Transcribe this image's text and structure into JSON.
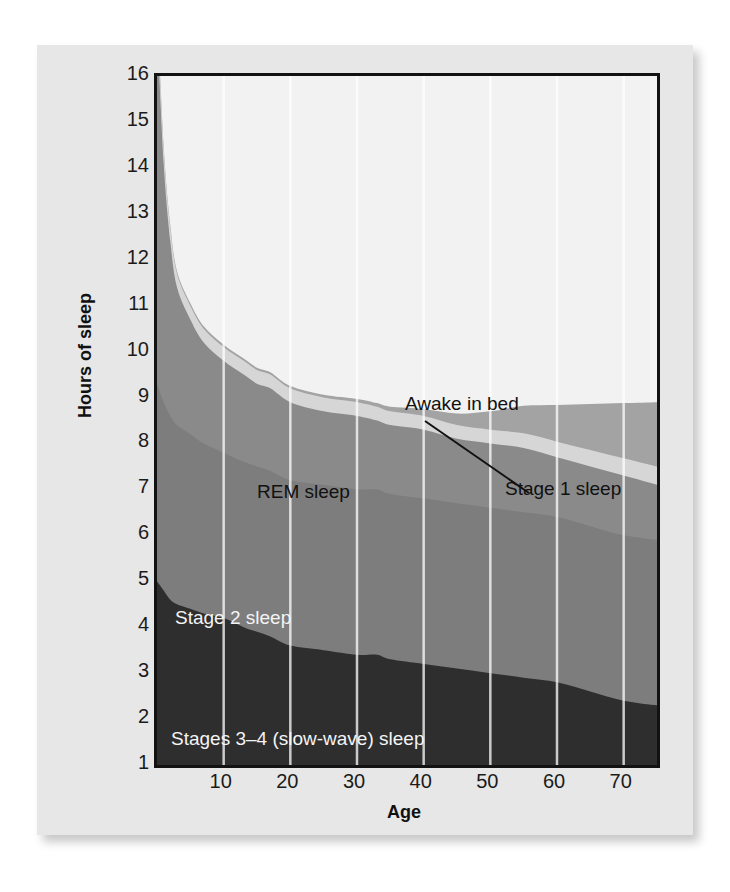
{
  "figure": {
    "background_color": "#e7e7e7",
    "plot_background_color": "#f2f2f2",
    "frame_color": "#121212",
    "gridline_color": "#ffffff"
  },
  "axes": {
    "y_title": "Hours of sleep",
    "x_title": "Age",
    "y_ticks": [
      "16",
      "15",
      "14",
      "13",
      "12",
      "11",
      "10",
      "9",
      "8",
      "7",
      "6",
      "5",
      "4",
      "3",
      "2",
      "1"
    ],
    "x_ticks": [
      "10",
      "20",
      "30",
      "40",
      "50",
      "60",
      "70"
    ]
  },
  "annotations": {
    "awake": "Awake in bed",
    "stage1": "Stage 1 sleep",
    "rem": "REM sleep",
    "stage2": "Stage 2 sleep",
    "stage34": "Stages 3–4 (slow-wave) sleep"
  },
  "chart_data": {
    "type": "area",
    "title": "",
    "subtitle": "",
    "xlabel": "Age",
    "ylabel": "Hours of sleep",
    "xlim": [
      0,
      75
    ],
    "ylim": [
      1,
      16
    ],
    "grid": "vertical gridlines at every 10 years",
    "legend": "inline labels inside bands",
    "stacked": true,
    "note": "Stacked area chart of sleep-stage hours across the lifespan. Bands stack from the bottom: Stages 3-4 (slow-wave) sleep, Stage 2 sleep, REM sleep, Stage 1 sleep, Awake in bed. The top of the stack is total time in bed. Baseline of the plot is 1 hour, not 0.",
    "x": [
      0,
      1,
      2,
      3,
      5,
      7,
      10,
      13,
      15,
      17,
      20,
      25,
      30,
      33,
      35,
      40,
      45,
      50,
      55,
      60,
      65,
      70,
      75
    ],
    "series": [
      {
        "name": "Stages 3–4 (slow-wave) sleep",
        "color": "#2e2e2e",
        "label_color": "#f4f4f4",
        "values": [
          4.0,
          3.8,
          3.6,
          3.5,
          3.4,
          3.3,
          3.2,
          3.0,
          2.9,
          2.8,
          2.6,
          2.5,
          2.4,
          2.4,
          2.3,
          2.2,
          2.1,
          2.0,
          1.9,
          1.8,
          1.6,
          1.4,
          1.3
        ]
      },
      {
        "name": "Stage 2 sleep",
        "color": "#7d7d7d",
        "label_color": "#f4f4f4",
        "values": [
          4.3,
          4.1,
          4.0,
          3.9,
          3.8,
          3.7,
          3.6,
          3.6,
          3.6,
          3.6,
          3.6,
          3.6,
          3.6,
          3.6,
          3.6,
          3.6,
          3.6,
          3.6,
          3.6,
          3.6,
          3.6,
          3.6,
          3.6
        ]
      },
      {
        "name": "REM sleep",
        "color": "#8a8a8a",
        "label_color": "#111111",
        "values": [
          7.8,
          5.2,
          3.8,
          3.0,
          2.5,
          2.2,
          2.0,
          1.9,
          1.8,
          1.8,
          1.7,
          1.6,
          1.6,
          1.5,
          1.5,
          1.5,
          1.4,
          1.4,
          1.4,
          1.3,
          1.3,
          1.3,
          1.2
        ]
      },
      {
        "name": "Stage 1 sleep",
        "color": "#d6d6d6",
        "label_color": "#111111",
        "values": [
          0.35,
          0.32,
          0.3,
          0.3,
          0.3,
          0.3,
          0.3,
          0.3,
          0.3,
          0.3,
          0.3,
          0.3,
          0.3,
          0.3,
          0.3,
          0.3,
          0.3,
          0.3,
          0.32,
          0.34,
          0.36,
          0.38,
          0.4
        ]
      },
      {
        "name": "Awake in bed",
        "color": "#a3a3a3",
        "label_color": "#111111",
        "values": [
          0.05,
          0.05,
          0.05,
          0.05,
          0.05,
          0.05,
          0.05,
          0.05,
          0.05,
          0.05,
          0.05,
          0.06,
          0.07,
          0.08,
          0.1,
          0.15,
          0.25,
          0.4,
          0.6,
          0.8,
          1.0,
          1.2,
          1.4
        ]
      }
    ],
    "total_hours_in_bed": [
      15.5,
      12.5,
      10.7,
      9.75,
      9.05,
      8.55,
      8.15,
      7.85,
      7.65,
      7.55,
      7.25,
      7.06,
      6.97,
      6.88,
      6.75,
      6.75,
      6.65,
      6.7,
      6.82,
      6.84,
      6.86,
      6.88,
      6.9
    ]
  }
}
